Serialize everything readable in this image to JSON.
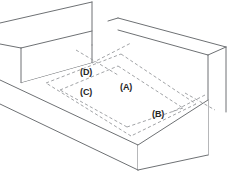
{
  "diagram": {
    "type": "isometric-line-drawing",
    "background_color": "#ffffff",
    "solid_line_color": "#6e7174",
    "dashed_line_color": "#96999c",
    "label_color": "#262626",
    "labels": [
      {
        "id": "A",
        "text": "(A)",
        "x": 120,
        "y": 83
      },
      {
        "id": "B",
        "text": "(B)",
        "x": 152,
        "y": 110
      },
      {
        "id": "C",
        "text": "(C)",
        "x": 80,
        "y": 88
      },
      {
        "id": "D",
        "text": "(D)",
        "x": 80,
        "y": 68
      }
    ]
  }
}
